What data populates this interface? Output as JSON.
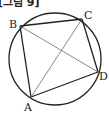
{
  "figure": {
    "caption": "[그림 9]",
    "circle": {
      "cx": 55,
      "cy": 59,
      "r": 46
    },
    "points": {
      "A": {
        "label": "A",
        "x": 31,
        "y": 97,
        "lx": 24,
        "ly": 111
      },
      "B": {
        "label": "B",
        "x": 20,
        "y": 26,
        "lx": 9,
        "ly": 28
      },
      "C": {
        "label": "C",
        "x": 82,
        "y": 19,
        "lx": 84,
        "ly": 19
      },
      "D": {
        "label": "D",
        "x": 98,
        "y": 72,
        "lx": 99,
        "ly": 80
      }
    },
    "sides": [
      "AB",
      "BC",
      "CD",
      "DA"
    ],
    "diagonals": [
      "AC",
      "BD"
    ],
    "colors": {
      "stroke": "#222222",
      "diagonal": "#555555"
    }
  }
}
